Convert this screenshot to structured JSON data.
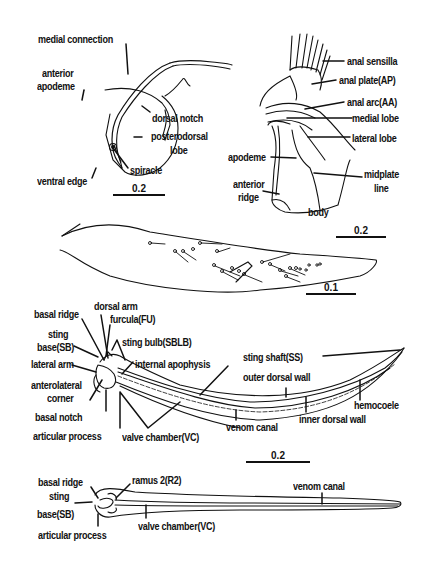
{
  "figure": {
    "panel_spiracle_plate": {
      "labels": {
        "medial_connection": "medial connection",
        "anterior_apodeme": "anterior apodeme",
        "anterior_apodeme_l1": "anterior",
        "anterior_apodeme_l2": "apodeme",
        "dorsal_notch": "dorsal notch",
        "posterodorsal_lobe_l1": "posterodorsal",
        "posterodorsal_lobe_l2": "lobe",
        "spiracle": "spiracle",
        "ventral_edge": "ventral edge"
      },
      "scale_bar": "0.2"
    },
    "panel_anal_plate": {
      "labels": {
        "anal_sensilla": "anal sensilla",
        "anal_plate": "anal plate(AP)",
        "anal_arc": "anal arc(AA)",
        "medial_lobe": "medial lobe",
        "lateral_lobe": "lateral lobe",
        "apodeme": "apodeme",
        "midplate_line_l1": "midplate",
        "midplate_line_l2": "line",
        "anterior_ridge_l1": "anterior",
        "anterior_ridge_l2": "ridge",
        "body": "body"
      },
      "scale_bar": "0.2"
    },
    "panel_gonostylus": {
      "labels": {},
      "scale_bar": "0.1"
    },
    "panel_sting_lateral": {
      "labels": {
        "basal_ridge": "basal ridge",
        "dorsal_arm": "dorsal arm",
        "furcula": "furcula(FU)",
        "sting_base_l1": "sting",
        "sting_base_l2": "base(SB)",
        "sting_bulb": "sting bulb(SBLB)",
        "lateral_arm": "lateral arm",
        "internal_apophysis": "internal apophysis",
        "anterolateral_corner_l1": "anterolateral",
        "anterolateral_corner_l2": "corner",
        "basal_notch": "basal notch",
        "articular_process": "articular process",
        "valve_chamber": "valve chamber(VC)",
        "sting_shaft": "sting shaft(SS)",
        "outer_dorsal_wall": "outer dorsal wall",
        "hemocoele": "hemocoele",
        "inner_dorsal_wall": "inner dorsal wall",
        "venom_canal": "venom canal"
      },
      "scale_bar": "0.2"
    },
    "panel_sting_dorsal": {
      "labels": {
        "basal_ridge": "basal ridge",
        "ramus_2": "ramus 2(R2)",
        "venom_canal": "venom canal",
        "sting_base_l1": "sting",
        "sting_base_l2": "base(SB)",
        "valve_chamber": "valve chamber(VC)",
        "articular_process": "articular process"
      }
    }
  }
}
